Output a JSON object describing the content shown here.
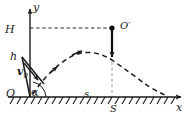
{
  "figure": {
    "axes": {
      "y_label": "y",
      "x_label": "x",
      "origin_label": "O"
    },
    "labels": {
      "max_height": "H",
      "initial_height": "h",
      "angle": "α",
      "velocity": "v",
      "velocity_subscript": "0",
      "drop_point": "O′",
      "horizontal_distance": "s",
      "apex_distance": "S"
    },
    "colors": {
      "stroke": "#1a1a1a",
      "dash": "#2b2b2b",
      "background": "#ffffff"
    },
    "geometry": {
      "origin": [
        30,
        97
      ],
      "apex": [
        112,
        60
      ],
      "drop_point": [
        112,
        28
      ],
      "h_line_y": 28,
      "landing": [
        170,
        97
      ]
    }
  }
}
